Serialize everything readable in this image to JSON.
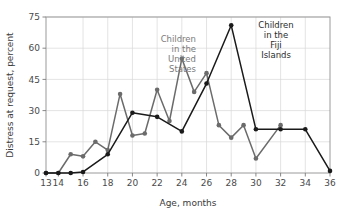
{
  "chart_data": {
    "type": "line",
    "title": "",
    "xlabel": "Age, months",
    "ylabel": "Distress at request, percent",
    "xlim": [
      13,
      36
    ],
    "ylim": [
      0,
      75
    ],
    "yticks": [
      0,
      15,
      30,
      45,
      60,
      75
    ],
    "ytick_labels": [
      "0",
      "15",
      "30",
      "45",
      "60",
      "75"
    ],
    "xticks": [
      13,
      14,
      16,
      18,
      20,
      22,
      24,
      26,
      28,
      30,
      32,
      34,
      36
    ],
    "xtick_labels": [
      "13",
      "14",
      "16",
      "18",
      "20",
      "22",
      "24",
      "26",
      "28",
      "30",
      "32",
      "34",
      "36"
    ],
    "grid": true,
    "grid_color": "#d8d8d8",
    "legend_position": "inline-annotations",
    "series": [
      {
        "name": "Children in the United States",
        "color": "#6b6b6b",
        "marker": "circle",
        "x": [
          13,
          14,
          15,
          16,
          17,
          18,
          19,
          20,
          21,
          22,
          23,
          24,
          25,
          26,
          27,
          28,
          29,
          30,
          32
        ],
        "values": [
          0,
          0,
          9,
          8,
          15,
          11,
          38,
          18,
          19,
          40,
          25,
          55,
          39,
          48,
          23,
          17,
          23,
          7,
          23
        ]
      },
      {
        "name": "Children in the Fiji Islands",
        "color": "#1a1a1a",
        "marker": "circle",
        "x": [
          13,
          14,
          15,
          16,
          18,
          20,
          22,
          24,
          26,
          28,
          30,
          32,
          34,
          36
        ],
        "values": [
          0,
          0,
          0,
          0.5,
          9,
          29,
          27,
          20,
          43,
          71,
          21,
          21,
          21,
          1
        ]
      }
    ],
    "annotations": [
      {
        "id": "us-label",
        "text": "Children in the United States",
        "lines": [
          "Children",
          "in the",
          "United",
          "States"
        ],
        "color": "#7a7a7a",
        "align": "right",
        "x_px": 196,
        "y_px": 42
      },
      {
        "id": "fiji-label",
        "text": "Children in the Fiji Islands",
        "lines": [
          "Children",
          "in the",
          "Fiji",
          "Islands"
        ],
        "color": "#2b2b2b",
        "align": "center",
        "x_px": 276,
        "y_px": 28
      }
    ]
  }
}
